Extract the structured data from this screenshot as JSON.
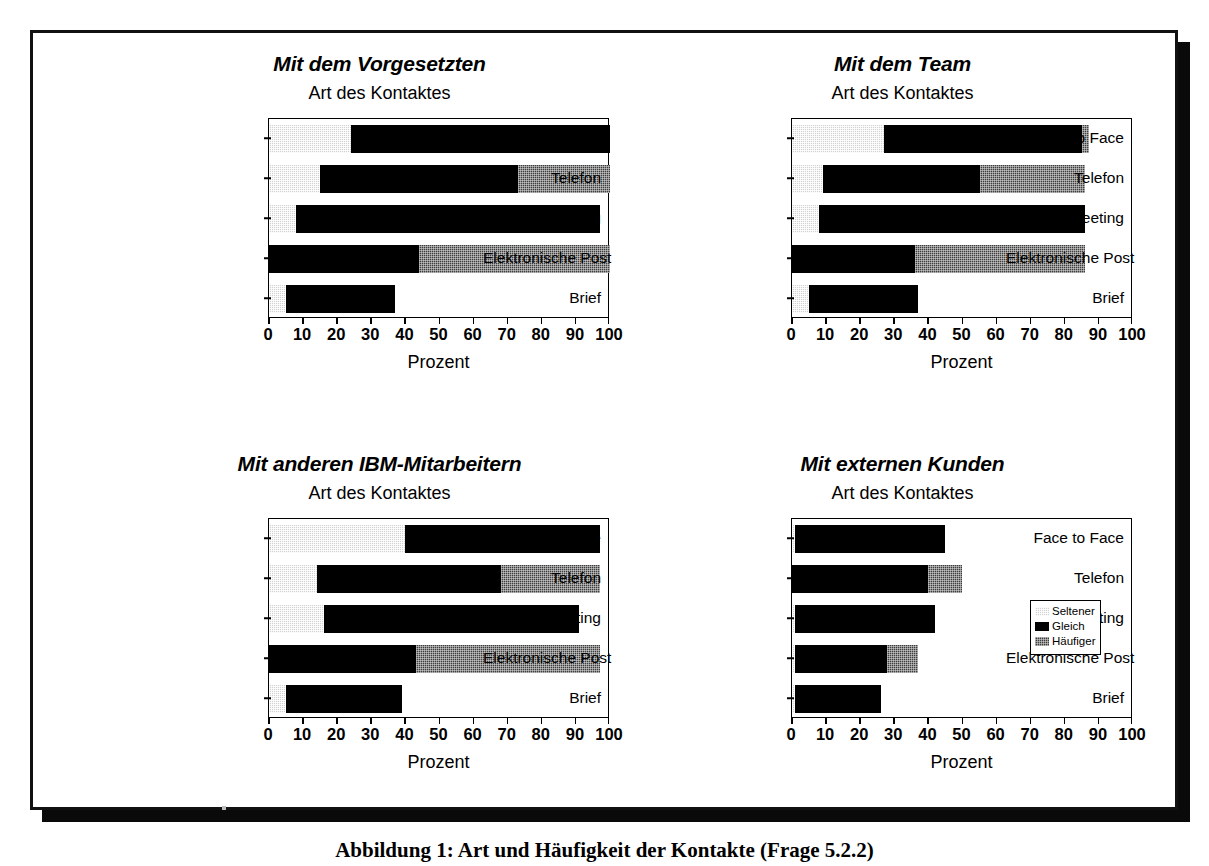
{
  "legend": {
    "items": [
      {
        "label": "Seltener",
        "swatch": "light-dotted-swatch",
        "color": "#d2d2d2"
      },
      {
        "label": "Gleich",
        "swatch": "black-swatch",
        "color": "#000000"
      },
      {
        "label": "Häufiger",
        "swatch": "dark-dotted-swatch",
        "color": "#3d3d3d"
      }
    ]
  },
  "caption": "Abbildung 1: Art und Häufigkeit der Kontakte (Frage 5.2.2)",
  "axis": {
    "title": "Prozent",
    "ticks": [
      "0",
      "10",
      "20",
      "30",
      "40",
      "50",
      "60",
      "70",
      "80",
      "90",
      "100"
    ],
    "min": 0,
    "max": 100
  },
  "categories": [
    "Face to Face",
    "Telefon",
    "Meeting",
    "Elektronische Post",
    "Brief"
  ],
  "subtitle": "Art des Kontaktes",
  "chart_data": [
    {
      "type": "bar",
      "orientation": "horizontal",
      "stacked": true,
      "title": "Mit dem Vorgesetzten",
      "subtitle": "Art des Kontaktes",
      "xlabel": "Prozent",
      "ylabel": "",
      "xlim": [
        0,
        100
      ],
      "grid": false,
      "legend_position": "none",
      "categories": [
        "Face to Face",
        "Telefon",
        "Meeting",
        "Elektronische Post",
        "Brief"
      ],
      "series": [
        {
          "name": "Seltener",
          "values": [
            24,
            15,
            8,
            0,
            5
          ]
        },
        {
          "name": "Gleich",
          "values": [
            76,
            58,
            89,
            44,
            32
          ]
        },
        {
          "name": "Häufiger",
          "values": [
            0,
            27,
            0,
            56,
            0
          ]
        }
      ]
    },
    {
      "type": "bar",
      "orientation": "horizontal",
      "stacked": true,
      "title": "Mit dem Team",
      "subtitle": "Art des Kontaktes",
      "xlabel": "Prozent",
      "ylabel": "",
      "xlim": [
        0,
        100
      ],
      "grid": false,
      "legend_position": "none",
      "categories": [
        "Face to Face",
        "Telefon",
        "Meeting",
        "Elektronische Post",
        "Brief"
      ],
      "series": [
        {
          "name": "Seltener",
          "values": [
            27,
            9,
            8,
            0,
            5
          ]
        },
        {
          "name": "Gleich",
          "values": [
            58,
            46,
            78,
            36,
            32
          ]
        },
        {
          "name": "Häufiger",
          "values": [
            2,
            31,
            0,
            50,
            0
          ]
        }
      ]
    },
    {
      "type": "bar",
      "orientation": "horizontal",
      "stacked": true,
      "title": "Mit anderen IBM-Mitarbeitern",
      "subtitle": "Art des Kontaktes",
      "xlabel": "Prozent",
      "ylabel": "",
      "xlim": [
        0,
        100
      ],
      "grid": false,
      "legend_position": "none",
      "categories": [
        "Face to Face",
        "Telefon",
        "Meeting",
        "Elektronische Post",
        "Brief"
      ],
      "series": [
        {
          "name": "Seltener",
          "values": [
            40,
            14,
            16,
            0,
            5
          ]
        },
        {
          "name": "Gleich",
          "values": [
            57,
            54,
            75,
            43,
            34
          ]
        },
        {
          "name": "Häufiger",
          "values": [
            0,
            29,
            0,
            54,
            0
          ]
        }
      ]
    },
    {
      "type": "bar",
      "orientation": "horizontal",
      "stacked": true,
      "title": "Mit externen Kunden",
      "subtitle": "Art des Kontaktes",
      "xlabel": "Prozent",
      "ylabel": "",
      "xlim": [
        0,
        100
      ],
      "grid": false,
      "legend_position": "inside-right",
      "categories": [
        "Face to Face",
        "Telefon",
        "Meeting",
        "Elektronische Post",
        "Brief"
      ],
      "series": [
        {
          "name": "Seltener",
          "values": [
            1,
            0,
            1,
            1,
            1
          ]
        },
        {
          "name": "Gleich",
          "values": [
            44,
            40,
            41,
            27,
            25
          ]
        },
        {
          "name": "Häufiger",
          "values": [
            0,
            10,
            0,
            9,
            0
          ]
        }
      ]
    }
  ]
}
